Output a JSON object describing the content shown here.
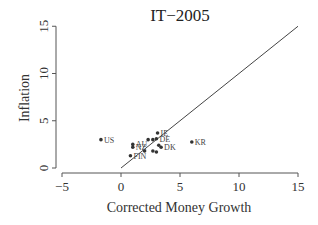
{
  "chart_data": {
    "type": "scatter",
    "title": "IT−2005",
    "xlabel": "Corrected Money Growth",
    "ylabel": "Inflation",
    "xlim": [
      -5,
      15
    ],
    "ylim": [
      0,
      15
    ],
    "xticks": [
      -5,
      0,
      5,
      10,
      15
    ],
    "yticks": [
      0,
      5,
      10,
      15
    ],
    "grid": false,
    "reference_line": {
      "type": "45-degree",
      "from": [
        0,
        0
      ],
      "to": [
        15,
        15
      ]
    },
    "points": [
      {
        "label": "US",
        "x": -1.7,
        "y": 3.0
      },
      {
        "label": "KR",
        "x": 6.0,
        "y": 2.75
      },
      {
        "label": "IE",
        "x": 3.1,
        "y": 3.7
      },
      {
        "label": "AU",
        "x": 1.0,
        "y": 2.5
      },
      {
        "label": "NZ",
        "x": 1.0,
        "y": 2.2
      },
      {
        "label": "FIN",
        "x": 0.8,
        "y": 1.3
      },
      {
        "label": "",
        "x": 2.3,
        "y": 3.0
      },
      {
        "label": "",
        "x": 2.7,
        "y": 3.0
      },
      {
        "label": "DE",
        "x": 3.0,
        "y": 3.1
      },
      {
        "label": "",
        "x": 3.2,
        "y": 2.4
      },
      {
        "label": "DK",
        "x": 3.4,
        "y": 2.2
      },
      {
        "label": "",
        "x": 2.0,
        "y": 1.8
      },
      {
        "label": "",
        "x": 2.7,
        "y": 1.8
      },
      {
        "label": "",
        "x": 3.0,
        "y": 1.7
      }
    ]
  }
}
